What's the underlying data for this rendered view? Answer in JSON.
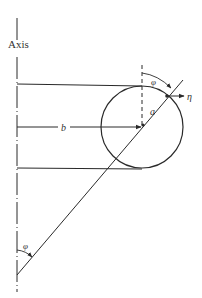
{
  "diagram": {
    "axis_label": "Axis",
    "labels": {
      "b": "b",
      "a": "a",
      "phi_top": "φ",
      "phi_bottom": "φ",
      "eta": "η"
    },
    "colors": {
      "stroke": "#2a2a2a",
      "background": "#ffffff"
    },
    "geometry": {
      "axis_x": 17,
      "circle_center": [
        142,
        127
      ],
      "circle_radius": 41,
      "top_line_y": 86,
      "bottom_line_y": 169,
      "diagonal_start": [
        17,
        275
      ],
      "diagonal_end": [
        183,
        80
      ]
    }
  }
}
